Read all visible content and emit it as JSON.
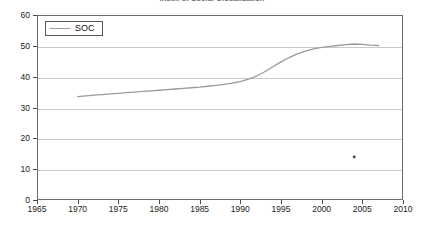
{
  "chart_data": {
    "type": "line",
    "title": "Index of Social Globalization",
    "xlabel": "",
    "ylabel": "",
    "xlim": [
      1965,
      2010
    ],
    "ylim": [
      0,
      60
    ],
    "xticks": [
      1965,
      1970,
      1975,
      1980,
      1985,
      1990,
      1995,
      2000,
      2005,
      2010
    ],
    "yticks": [
      0,
      10,
      20,
      30,
      40,
      50,
      60
    ],
    "grid": "horizontal",
    "legend_position": "top-left",
    "series": [
      {
        "name": "SOC",
        "color": "#9a9a9a",
        "style": "line",
        "x": [
          1970,
          1971,
          1972,
          1973,
          1974,
          1975,
          1976,
          1977,
          1978,
          1979,
          1980,
          1981,
          1982,
          1983,
          1984,
          1985,
          1986,
          1987,
          1988,
          1989,
          1990,
          1991,
          1992,
          1993,
          1994,
          1995,
          1996,
          1997,
          1998,
          1999,
          2000,
          2001,
          2002,
          2003,
          2004,
          2005,
          2006,
          2007
        ],
        "values": [
          33.5,
          33.8,
          34.0,
          34.2,
          34.4,
          34.6,
          34.8,
          35.0,
          35.2,
          35.4,
          35.6,
          35.8,
          36.0,
          36.2,
          36.4,
          36.6,
          36.9,
          37.2,
          37.5,
          37.9,
          38.4,
          39.2,
          40.2,
          41.6,
          43.2,
          44.8,
          46.2,
          47.4,
          48.3,
          49.0,
          49.5,
          49.8,
          50.1,
          50.4,
          50.6,
          50.5,
          50.2,
          50.1
        ]
      },
      {
        "name": "isolated-point",
        "color": "#4a4a4a",
        "style": "marker",
        "x": [
          2004
        ],
        "values": [
          14.0
        ]
      }
    ]
  },
  "legend": {
    "entries": [
      {
        "label": "SOC",
        "color": "#9a9a9a"
      }
    ]
  },
  "axes": {
    "y_labels": [
      "60",
      "50",
      "40",
      "30",
      "20",
      "10",
      "0"
    ],
    "x_labels": [
      "1965",
      "1970",
      "1975",
      "1980",
      "1985",
      "1990",
      "1995",
      "2000",
      "2005",
      "2010"
    ]
  },
  "colors": {
    "series_line": "#9a9a9a",
    "grid": "#c9c9c9",
    "frame": "#6d6d6d",
    "text": "#1a1a1a",
    "title": "#6b6b6b",
    "marker": "#4a4a4a"
  }
}
